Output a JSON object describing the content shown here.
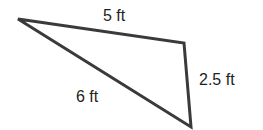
{
  "diagram": {
    "type": "triangle",
    "stroke_color": "#3a3a3a",
    "vertices": [
      [
        18,
        19
      ],
      [
        184,
        43
      ],
      [
        191,
        127
      ]
    ],
    "sides": [
      {
        "label": "5 ft",
        "between": [
          0,
          1
        ]
      },
      {
        "label": "2.5 ft",
        "between": [
          1,
          2
        ]
      },
      {
        "label": "6 ft",
        "between": [
          0,
          2
        ]
      }
    ]
  }
}
